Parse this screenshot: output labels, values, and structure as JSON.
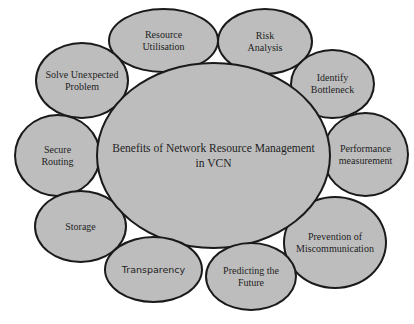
{
  "diagram": {
    "type": "hub-and-spoke",
    "fill_color": "#bdbdbd",
    "stroke_color": "#1a1a1a",
    "center": {
      "label": "Benefits of Network Resource Management\nin VCN"
    },
    "nodes": [
      {
        "id": "resource-utilisation",
        "label": "Resource\nUtilisation"
      },
      {
        "id": "risk-analysis",
        "label": "Risk\nAnalysis"
      },
      {
        "id": "identify-bottleneck",
        "label": "Identify\nBottleneck"
      },
      {
        "id": "performance-measurement",
        "label": "Performance\nmeasurement"
      },
      {
        "id": "prevention-of-miscommunication",
        "label": "Prevention of\nMiscommunication"
      },
      {
        "id": "predicting-the-future",
        "label": "Predicting the\nFuture"
      },
      {
        "id": "transparency",
        "label": "Transparency"
      },
      {
        "id": "storage",
        "label": "Storage"
      },
      {
        "id": "secure-routing",
        "label": "Secure\nRouting"
      },
      {
        "id": "solve-unexpected-problem",
        "label": "Solve Unexpected\nProblem"
      }
    ]
  }
}
